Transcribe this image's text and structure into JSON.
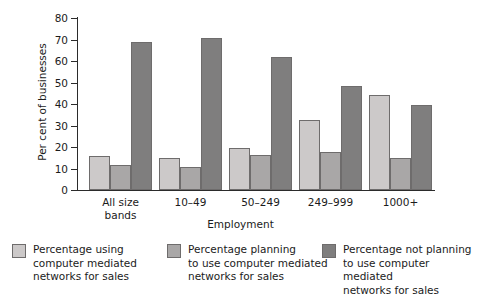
{
  "chart_data": {
    "type": "bar",
    "title": "",
    "xlabel": "Employment",
    "ylabel": "Per cent of businesses",
    "categories": [
      "All size\nbands",
      "10–49",
      "50–249",
      "249–999",
      "1000+"
    ],
    "ylim": [
      0,
      80
    ],
    "yticks": [
      0,
      10,
      20,
      30,
      40,
      50,
      60,
      70,
      80
    ],
    "grid": false,
    "legend_position": "bottom",
    "series": [
      {
        "name": "Percentage using\ncomputer mediated\nnetworks for sales",
        "color": "#ccc9c9",
        "values": [
          16,
          15,
          19.5,
          32.5,
          44
        ]
      },
      {
        "name": "Percentage planning\nto use computer mediated\nnetworks for sales",
        "color": "#a9a7a7",
        "values": [
          11.5,
          10.5,
          16.5,
          17.5,
          15
        ]
      },
      {
        "name": "Percentage not planning\nto use computer mediated\nnetworks for sales",
        "color": "#7f7e7e",
        "values": [
          69,
          70.5,
          62,
          48.5,
          39.5
        ]
      }
    ]
  }
}
